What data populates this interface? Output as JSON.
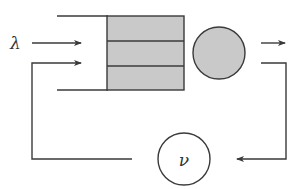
{
  "diagram": {
    "labels": {
      "arrival_rate": "λ",
      "feedback_node": "ν"
    },
    "colors": {
      "stroke": "#3a3a3a",
      "queue_fill": "#c9c9c9",
      "server_fill": "#c9c9c9",
      "background": "#ffffff"
    },
    "nodes": [
      {
        "id": "queue",
        "type": "buffer",
        "slots": 3
      },
      {
        "id": "server",
        "type": "circle"
      },
      {
        "id": "feedback",
        "type": "circle",
        "label": "ν"
      }
    ],
    "edges": [
      {
        "from": "external",
        "to": "queue",
        "label": "λ"
      },
      {
        "from": "server",
        "to": "exit"
      },
      {
        "from": "server",
        "to": "feedback"
      },
      {
        "from": "feedback",
        "to": "queue"
      }
    ]
  }
}
